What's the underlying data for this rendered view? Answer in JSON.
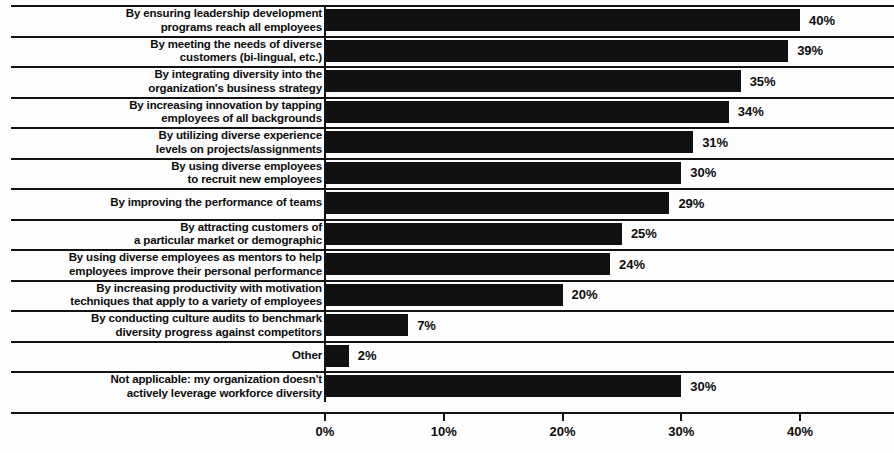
{
  "chart_data": {
    "type": "bar",
    "orientation": "horizontal",
    "title": "",
    "subtitle": "",
    "xlabel": "",
    "ylabel": "",
    "xlim": [
      0,
      45
    ],
    "grid": false,
    "legend": null,
    "xticks": [
      "0%",
      "10%",
      "20%",
      "30%",
      "40%"
    ],
    "xtick_values": [
      0,
      10,
      20,
      30,
      40
    ],
    "value_suffix": "%",
    "categories": [
      "By ensuring leadership development\nprograms reach all employees",
      "By meeting the needs of diverse\ncustomers (bi-lingual, etc.)",
      "By integrating diversity into the\norganization's business strategy",
      "By increasing innovation by tapping\nemployees of all backgrounds",
      "By utilizing diverse experience\nlevels on projects/assignments",
      "By using diverse employees\nto recruit new employees",
      "By improving the performance of teams",
      "By attracting customers of\na particular market or demographic",
      "By using diverse employees as mentors to help\nemployees improve their personal performance",
      "By increasing productivity with motivation\ntechniques that apply to a variety of employees",
      "By conducting culture audits to benchmark\ndiversity progress against competitors",
      "Other",
      "Not applicable: my organization doesn't\nactively leverage workforce diversity"
    ],
    "values": [
      40,
      39,
      35,
      34,
      31,
      30,
      29,
      25,
      24,
      20,
      7,
      2,
      30
    ],
    "value_labels": [
      "40%",
      "39%",
      "35%",
      "34%",
      "31%",
      "30%",
      "29%",
      "25%",
      "24%",
      "20%",
      "7%",
      "2%",
      "30%"
    ],
    "bar_color": "#111111",
    "axis_color": "#141414",
    "text_color": "#0c0c0c",
    "background_color": "#fdfdfd"
  }
}
